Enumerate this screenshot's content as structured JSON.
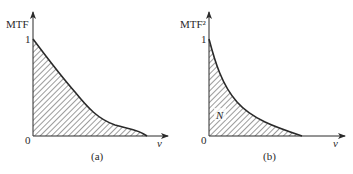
{
  "panels": [
    {
      "id": "a",
      "y_label": "MTF",
      "y_tick_top": "1",
      "origin": "0",
      "x_label": "ν",
      "caption": "(a)",
      "area_label": "",
      "curve": {
        "shape": "nearly linear decay with shoulder",
        "y_at_zero": 1,
        "cutoff_fraction": 0.84
      },
      "hatched": true
    },
    {
      "id": "b",
      "y_label": "MTF²",
      "y_tick_top": "1",
      "origin": "0",
      "x_label": "ν",
      "caption": "(b)",
      "area_label": "N",
      "curve": {
        "shape": "convex exponential-like decay",
        "y_at_zero": 1,
        "cutoff_fraction": 0.68
      },
      "hatched": true
    }
  ],
  "colors": {
    "ink": "#2a2a2a",
    "hatch": "#3a3a3a",
    "background": "#ffffff"
  }
}
